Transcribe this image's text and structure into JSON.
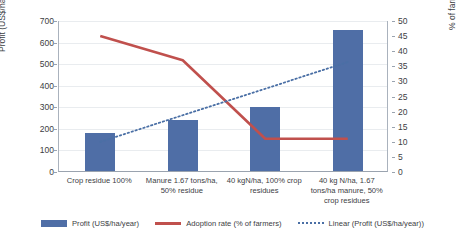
{
  "chart_data": {
    "type": "bar",
    "title": "",
    "categories": [
      "Crop residue 100%",
      "Manure 1.67 tons/ha, 50% residue",
      "40 kgN/ha, 100% crop residues",
      "40 kg N/ha, 1.67 tons/ha manure, 50% crop residues"
    ],
    "series": [
      {
        "name": "Profit (US$/ha/year)",
        "type": "bar",
        "axis": "left",
        "color": "#4f6ea6",
        "values": [
          175,
          235,
          295,
          655
        ]
      },
      {
        "name": "Adoption rate (% of farmers)",
        "type": "line",
        "axis": "right",
        "color": "#c0504d",
        "values": [
          45,
          37,
          11,
          11
        ]
      },
      {
        "name": "Linear (Profit (US$/ha/year))",
        "type": "line",
        "style": "dotted",
        "axis": "left",
        "color": "#4a6fa5",
        "values": [
          140,
          263,
          386,
          510
        ]
      }
    ],
    "ylabel": "Profit (US$/ha per year",
    "ylabel_right": "% of farming using",
    "xlabel": "",
    "ylim": [
      0,
      700
    ],
    "ylim_right": [
      0,
      50
    ],
    "yticks": [
      0,
      100,
      200,
      300,
      400,
      500,
      600,
      700
    ],
    "yticks_right": [
      0,
      5,
      10,
      15,
      20,
      25,
      30,
      35,
      40,
      45,
      50
    ],
    "grid": true,
    "legend_position": "bottom"
  },
  "axes": {
    "left_title": "Profit (US$/ha per year",
    "right_title": "% of farming using",
    "left_ticks": [
      "700",
      "600",
      "500",
      "400",
      "300",
      "200",
      "100",
      "0"
    ],
    "right_ticks": [
      "50",
      "45",
      "40",
      "35",
      "30",
      "25",
      "20",
      "15",
      "10",
      "5",
      "0"
    ]
  },
  "categories": [
    "Crop residue 100%",
    "Manure 1.67 tons/ha, 50% residue",
    "40 kgN/ha, 100% crop residues",
    "40 kg N/ha, 1.67 tons/ha manure, 50% crop residues"
  ],
  "legend": {
    "items": [
      {
        "label": "Profit (US$/ha/year)",
        "swatch": "bar-swatch",
        "color": "#4f6ea6"
      },
      {
        "label": "Adoption rate (% of farmers)",
        "swatch": "line-swatch",
        "color": "#c0504d"
      },
      {
        "label": "Linear (Profit (US$/ha/year))",
        "swatch": "dotted-line-swatch",
        "color": "#4a6fa5"
      }
    ]
  }
}
